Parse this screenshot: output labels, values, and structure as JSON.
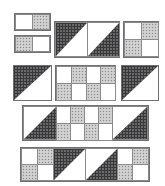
{
  "figure": {
    "background_color": "#ffffff",
    "palette": {
      "white": "#ffffff",
      "gray_speckled": "#c9c9c9",
      "dark_dotted": "#38383a",
      "outline": "#6f6f6f",
      "cell_outline": "#8a8a8a"
    },
    "canvas": {
      "width": 165,
      "height": 186
    },
    "fabric_names": {
      "white": "plain-white-fabric",
      "gray": "gray-speckled-fabric",
      "dark": "dark-dotted-fabric"
    }
  },
  "blocks": [
    {
      "id": "block-1",
      "name": "two-patch-white-gray",
      "x": 14,
      "y": 13,
      "w": 37,
      "h": 18,
      "layout": "1x2",
      "cells": [
        {
          "fill": "white",
          "shape": "square"
        },
        {
          "fill": "gray",
          "shape": "square"
        }
      ]
    },
    {
      "id": "block-2",
      "name": "two-patch-gray-white",
      "x": 14,
      "y": 35,
      "w": 37,
      "h": 18,
      "layout": "1x2",
      "cells": [
        {
          "fill": "gray",
          "shape": "square"
        },
        {
          "fill": "white",
          "shape": "square"
        }
      ]
    },
    {
      "id": "block-3",
      "name": "double-half-square-triangle-bar",
      "x": 54,
      "y": 21,
      "w": 66,
      "h": 37,
      "layout": "1x2",
      "cells": [
        {
          "fill": "dark",
          "shape": "triangle",
          "corner": "top-left",
          "background": "white"
        },
        {
          "fill": "dark",
          "shape": "triangle",
          "corner": "bottom-right",
          "background": "white"
        }
      ]
    },
    {
      "id": "block-4",
      "name": "four-patch-checker",
      "x": 123,
      "y": 21,
      "w": 36,
      "h": 37,
      "layout": "2x2",
      "cells": [
        {
          "fill": "white",
          "shape": "square"
        },
        {
          "fill": "gray",
          "shape": "square"
        },
        {
          "fill": "gray",
          "shape": "square"
        },
        {
          "fill": "white",
          "shape": "square"
        }
      ]
    },
    {
      "id": "block-5",
      "name": "half-square-triangle-top-left",
      "x": 13,
      "y": 65,
      "w": 39,
      "h": 36,
      "layout": "1x1",
      "cells": [
        {
          "fill": "dark",
          "shape": "triangle",
          "corner": "top-left",
          "background": "white"
        }
      ]
    },
    {
      "id": "block-6",
      "name": "eight-patch-checkerboard",
      "x": 55,
      "y": 65,
      "w": 61,
      "h": 36,
      "layout": "2x4",
      "cells": [
        {
          "fill": "white",
          "shape": "square"
        },
        {
          "fill": "gray",
          "shape": "square"
        },
        {
          "fill": "white",
          "shape": "square"
        },
        {
          "fill": "gray",
          "shape": "square"
        },
        {
          "fill": "gray",
          "shape": "square"
        },
        {
          "fill": "white",
          "shape": "square"
        },
        {
          "fill": "gray",
          "shape": "square"
        },
        {
          "fill": "white",
          "shape": "square"
        }
      ]
    },
    {
      "id": "block-7",
      "name": "half-square-triangle-top-left-right",
      "x": 121,
      "y": 65,
      "w": 38,
      "h": 36,
      "layout": "1x1",
      "cells": [
        {
          "fill": "dark",
          "shape": "triangle",
          "corner": "top-left",
          "background": "white"
        }
      ]
    },
    {
      "id": "block-8",
      "name": "long-strip-triangles-and-checker",
      "x": 22,
      "y": 105,
      "w": 127,
      "h": 36,
      "layout": "2x6",
      "cells": [
        {
          "fill": "dark",
          "shape": "triangle",
          "corner": "bottom-right",
          "background": "white",
          "span": "full-height"
        },
        {
          "fill": "white",
          "shape": "square"
        },
        {
          "fill": "gray",
          "shape": "square"
        },
        {
          "fill": "white",
          "shape": "square"
        },
        {
          "fill": "gray",
          "shape": "square"
        },
        {
          "fill": "white",
          "shape": "square"
        },
        {
          "fill": "gray",
          "shape": "square"
        },
        {
          "fill": "white",
          "shape": "square"
        },
        {
          "fill": "gray",
          "shape": "square"
        },
        {
          "fill": "dark",
          "shape": "triangle",
          "corner": "bottom-right",
          "background": "white",
          "span": "full-height"
        }
      ]
    },
    {
      "id": "block-9",
      "name": "long-strip-fourpatch-and-triangles",
      "x": 20,
      "y": 147,
      "w": 130,
      "h": 35,
      "layout": "2x6",
      "cells": [
        {
          "fill": "white",
          "shape": "square"
        },
        {
          "fill": "gray",
          "shape": "square"
        },
        {
          "fill": "gray",
          "shape": "square"
        },
        {
          "fill": "white",
          "shape": "square"
        },
        {
          "fill": "dark",
          "shape": "triangle",
          "corner": "top-left",
          "background": "white",
          "span": "full-height"
        },
        {
          "fill": "dark",
          "shape": "triangle",
          "corner": "bottom-right",
          "background": "white",
          "span": "full-height"
        },
        {
          "fill": "white",
          "shape": "square"
        },
        {
          "fill": "gray",
          "shape": "square"
        },
        {
          "fill": "gray",
          "shape": "square"
        },
        {
          "fill": "white",
          "shape": "square"
        }
      ]
    }
  ]
}
